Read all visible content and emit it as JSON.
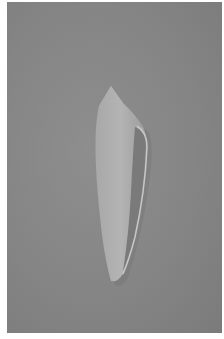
{
  "image": {
    "subject": "cone shell",
    "description": "Photograph of an elongated cone seashell on a plain grey background",
    "colors": {
      "background": "#858585",
      "shell_light": "#b9b9b9",
      "shell_mid": "#a2a2a2",
      "shell_shadow": "#6e6e6e"
    }
  }
}
